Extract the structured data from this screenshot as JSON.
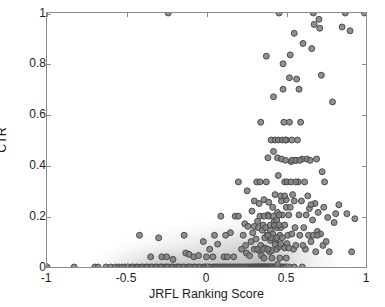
{
  "chart_data": {
    "type": "scatter",
    "title": "",
    "xlabel": "JRFL Ranking Score",
    "ylabel": "CTR",
    "xlim": [
      -1,
      1
    ],
    "ylim": [
      0,
      1
    ],
    "grid": false,
    "legend": null,
    "xticks": [
      "-1",
      "-0.5",
      "0",
      "0.5",
      "1"
    ],
    "xtickvalues": [
      -1,
      -0.5,
      0,
      0.5,
      1
    ],
    "yticks": [
      "0",
      "0.2",
      "0.4",
      "0.6",
      "0.8",
      "1"
    ],
    "ytickvalues": [
      0,
      0.2,
      0.4,
      0.6,
      0.8,
      1
    ],
    "marker": {
      "shape": "circle",
      "size": 6,
      "fill": "#7d7d7d",
      "edge": "#4a4a4a"
    },
    "axis_color": "#8a8a8a",
    "text_color": "#1c1c1c",
    "background": "#ffffff",
    "series": [
      {
        "name": "CTR vs JRFL Ranking Score",
        "points": [
          [
            -1.0,
            0.0
          ],
          [
            -0.83,
            0.0
          ],
          [
            -0.7,
            0.0
          ],
          [
            -0.68,
            0.0
          ],
          [
            -0.63,
            0.0
          ],
          [
            -0.6,
            0.0
          ],
          [
            -0.57,
            0.0
          ],
          [
            -0.55,
            0.0
          ],
          [
            -0.53,
            0.0
          ],
          [
            -0.51,
            0.0
          ],
          [
            -0.49,
            0.0
          ],
          [
            -0.47,
            0.0
          ],
          [
            -0.46,
            0.0
          ],
          [
            -0.44,
            0.0
          ],
          [
            -0.43,
            0.0
          ],
          [
            -0.41,
            0.0
          ],
          [
            -0.4,
            0.0
          ],
          [
            -0.38,
            0.0
          ],
          [
            -0.37,
            0.0
          ],
          [
            -0.35,
            0.0
          ],
          [
            -0.34,
            0.0
          ],
          [
            -0.32,
            0.0
          ],
          [
            -0.31,
            0.0
          ],
          [
            -0.29,
            0.0
          ],
          [
            -0.28,
            0.0
          ],
          [
            -0.26,
            0.0
          ],
          [
            -0.25,
            0.0
          ],
          [
            -0.24,
            0.0
          ],
          [
            -0.22,
            0.0
          ],
          [
            -0.21,
            0.0
          ],
          [
            -0.19,
            0.0
          ],
          [
            -0.18,
            0.0
          ],
          [
            -0.17,
            0.0
          ],
          [
            -0.15,
            0.0
          ],
          [
            -0.14,
            0.0
          ],
          [
            -0.12,
            0.0
          ],
          [
            -0.11,
            0.0
          ],
          [
            -0.1,
            0.0
          ],
          [
            -0.08,
            0.0
          ],
          [
            -0.07,
            0.0
          ],
          [
            -0.05,
            0.0
          ],
          [
            -0.04,
            0.0
          ],
          [
            -0.02,
            0.0
          ],
          [
            -0.01,
            0.0
          ],
          [
            0.0,
            0.0
          ],
          [
            0.01,
            0.0
          ],
          [
            0.02,
            0.0
          ],
          [
            0.04,
            0.0
          ],
          [
            0.05,
            0.0
          ],
          [
            0.06,
            0.0
          ],
          [
            0.07,
            0.0
          ],
          [
            0.08,
            0.0
          ],
          [
            0.09,
            0.0
          ],
          [
            0.1,
            0.0
          ],
          [
            0.11,
            0.0
          ],
          [
            0.12,
            0.0
          ],
          [
            0.13,
            0.0
          ],
          [
            0.14,
            0.0
          ],
          [
            0.15,
            0.0
          ],
          [
            0.16,
            0.0
          ],
          [
            0.17,
            0.0
          ],
          [
            0.18,
            0.0
          ],
          [
            0.19,
            0.0
          ],
          [
            0.2,
            0.0
          ],
          [
            0.21,
            0.0
          ],
          [
            0.22,
            0.0
          ],
          [
            0.23,
            0.0
          ],
          [
            0.24,
            0.0
          ],
          [
            0.25,
            0.0
          ],
          [
            0.26,
            0.0
          ],
          [
            0.27,
            0.0
          ],
          [
            0.28,
            0.0
          ],
          [
            0.285,
            0.0
          ],
          [
            0.29,
            0.0
          ],
          [
            0.3,
            0.0
          ],
          [
            0.305,
            0.0
          ],
          [
            0.31,
            0.0
          ],
          [
            0.315,
            0.0
          ],
          [
            0.32,
            0.0
          ],
          [
            0.325,
            0.0
          ],
          [
            0.33,
            0.0
          ],
          [
            0.335,
            0.0
          ],
          [
            0.34,
            0.0
          ],
          [
            0.345,
            0.0
          ],
          [
            0.35,
            0.0
          ],
          [
            0.355,
            0.0
          ],
          [
            0.36,
            0.0
          ],
          [
            0.365,
            0.0
          ],
          [
            0.37,
            0.0
          ],
          [
            0.375,
            0.0
          ],
          [
            0.38,
            0.0
          ],
          [
            0.385,
            0.0
          ],
          [
            0.39,
            0.0
          ],
          [
            0.395,
            0.0
          ],
          [
            0.4,
            0.0
          ],
          [
            0.405,
            0.0
          ],
          [
            0.41,
            0.0
          ],
          [
            0.415,
            0.0
          ],
          [
            0.42,
            0.0
          ],
          [
            0.43,
            0.0
          ],
          [
            0.44,
            0.0
          ],
          [
            0.45,
            0.0
          ],
          [
            0.46,
            0.0
          ],
          [
            0.47,
            0.0
          ],
          [
            0.48,
            0.0
          ],
          [
            0.49,
            0.0
          ],
          [
            0.5,
            0.0
          ],
          [
            0.52,
            0.0
          ],
          [
            0.55,
            0.0
          ],
          [
            0.6,
            0.0
          ],
          [
            0.445,
            0.01
          ],
          [
            -0.42,
            0.125
          ],
          [
            -0.35,
            0.04
          ],
          [
            -0.3,
            0.115
          ],
          [
            -0.28,
            0.04
          ],
          [
            -0.25,
            0.04
          ],
          [
            -0.21,
            0.03
          ],
          [
            -0.14,
            0.125
          ],
          [
            -0.13,
            0.055
          ],
          [
            -0.11,
            0.05
          ],
          [
            -0.08,
            0.04
          ],
          [
            -0.05,
            0.045
          ],
          [
            -0.02,
            0.1
          ],
          [
            0.0,
            0.04
          ],
          [
            0.02,
            0.07
          ],
          [
            0.04,
            0.04
          ],
          [
            0.05,
            0.125
          ],
          [
            0.07,
            0.09
          ],
          [
            0.09,
            0.2
          ],
          [
            0.11,
            0.04
          ],
          [
            0.13,
            0.04
          ],
          [
            0.15,
            0.135
          ],
          [
            0.17,
            0.04
          ],
          [
            0.18,
            0.2
          ],
          [
            0.2,
            0.335
          ],
          [
            0.2,
            0.2
          ],
          [
            0.22,
            0.07
          ],
          [
            0.23,
            0.125
          ],
          [
            0.24,
            0.17
          ],
          [
            0.25,
            0.055
          ],
          [
            0.255,
            0.3
          ],
          [
            0.26,
            0.16
          ],
          [
            0.27,
            0.045
          ],
          [
            0.28,
            0.1
          ],
          [
            0.285,
            0.22
          ],
          [
            0.29,
            0.135
          ],
          [
            0.3,
            0.16
          ],
          [
            0.3,
            0.26
          ],
          [
            0.31,
            0.11
          ],
          [
            0.315,
            0.335
          ],
          [
            0.32,
            0.18
          ],
          [
            0.325,
            0.155
          ],
          [
            0.33,
            0.25
          ],
          [
            0.335,
            0.335
          ],
          [
            0.34,
            0.57
          ],
          [
            0.34,
            0.085
          ],
          [
            0.345,
            0.045
          ],
          [
            0.35,
            0.145
          ],
          [
            0.355,
            0.165
          ],
          [
            0.36,
            0.265
          ],
          [
            0.365,
            0.075
          ],
          [
            0.37,
            0.155
          ],
          [
            0.375,
            0.335
          ],
          [
            0.375,
            0.83
          ],
          [
            0.38,
            0.125
          ],
          [
            0.385,
            0.43
          ],
          [
            0.385,
            0.205
          ],
          [
            0.39,
            0.255
          ],
          [
            0.395,
            0.06
          ],
          [
            0.4,
            0.145
          ],
          [
            0.4,
            0.105
          ],
          [
            0.405,
            0.5
          ],
          [
            0.41,
            0.065
          ],
          [
            0.415,
            0.13
          ],
          [
            0.42,
            0.455
          ],
          [
            0.42,
            0.67
          ],
          [
            0.425,
            0.18
          ],
          [
            0.43,
            0.5
          ],
          [
            0.43,
            0.285
          ],
          [
            0.435,
            0.105
          ],
          [
            0.44,
            0.07
          ],
          [
            0.44,
            0.155
          ],
          [
            0.445,
            0.43
          ],
          [
            0.445,
            0.215
          ],
          [
            0.45,
            0.5
          ],
          [
            0.45,
            0.36
          ],
          [
            0.455,
            0.08
          ],
          [
            0.455,
            1.0
          ],
          [
            0.46,
            0.125
          ],
          [
            0.465,
            0.155
          ],
          [
            0.47,
            0.26
          ],
          [
            0.47,
            0.425
          ],
          [
            0.475,
            0.205
          ],
          [
            0.48,
            0.8
          ],
          [
            0.48,
            0.7
          ],
          [
            0.485,
            0.57
          ],
          [
            0.49,
            0.165
          ],
          [
            0.49,
            0.335
          ],
          [
            0.495,
            0.42
          ],
          [
            0.5,
            0.5
          ],
          [
            0.5,
            0.265
          ],
          [
            0.505,
            0.092
          ],
          [
            0.51,
            0.125
          ],
          [
            0.515,
            0.205
          ],
          [
            0.52,
            0.57
          ],
          [
            0.52,
            0.745
          ],
          [
            0.525,
            0.835
          ],
          [
            0.53,
            0.415
          ],
          [
            0.535,
            0.13
          ],
          [
            0.54,
            0.285
          ],
          [
            0.545,
            0.07
          ],
          [
            0.55,
            0.26
          ],
          [
            0.55,
            0.92
          ],
          [
            0.555,
            0.155
          ],
          [
            0.56,
            0.42
          ],
          [
            0.565,
            0.74
          ],
          [
            0.57,
            0.5
          ],
          [
            0.575,
            0.335
          ],
          [
            0.58,
            0.205
          ],
          [
            0.58,
            0.7
          ],
          [
            0.585,
            0.125
          ],
          [
            0.59,
            0.57
          ],
          [
            0.595,
            0.26
          ],
          [
            0.6,
            0.425
          ],
          [
            0.605,
            0.88
          ],
          [
            0.61,
            0.155
          ],
          [
            0.615,
            0.335
          ],
          [
            0.62,
            0.07
          ],
          [
            0.625,
            0.205
          ],
          [
            0.63,
            0.425
          ],
          [
            0.635,
            0.28
          ],
          [
            0.64,
            0.125
          ],
          [
            0.645,
            0.23
          ],
          [
            0.65,
            0.42
          ],
          [
            0.655,
            0.1
          ],
          [
            0.66,
            0.86
          ],
          [
            0.665,
            0.185
          ],
          [
            0.67,
            1.0
          ],
          [
            0.675,
            0.955
          ],
          [
            0.68,
            0.25
          ],
          [
            0.685,
            0.06
          ],
          [
            0.69,
            0.425
          ],
          [
            0.695,
            0.14
          ],
          [
            0.7,
            0.215
          ],
          [
            0.705,
            0.975
          ],
          [
            0.71,
            0.94
          ],
          [
            0.715,
            0.13
          ],
          [
            0.72,
            0.755
          ],
          [
            0.725,
            0.375
          ],
          [
            0.73,
            0.085
          ],
          [
            0.735,
            0.235
          ],
          [
            0.74,
            0.335
          ],
          [
            0.75,
            0.1
          ],
          [
            0.76,
            0.195
          ],
          [
            0.77,
            0.06
          ],
          [
            0.79,
            0.65
          ],
          [
            0.8,
            0.175
          ],
          [
            0.81,
            0.21
          ],
          [
            0.83,
            0.245
          ],
          [
            0.85,
            0.945
          ],
          [
            0.87,
            1.0
          ],
          [
            0.88,
            0.21
          ],
          [
            0.9,
            0.93
          ],
          [
            0.91,
            0.06
          ],
          [
            0.93,
            0.19
          ],
          [
            0.99,
            1.0
          ],
          [
            -0.24,
            1.0
          ],
          [
            0.12,
            0.125
          ],
          [
            0.245,
            0.085
          ],
          [
            0.33,
            0.065
          ],
          [
            0.36,
            0.035
          ],
          [
            0.41,
            0.035
          ],
          [
            0.46,
            0.035
          ],
          [
            0.5,
            0.035
          ],
          [
            0.365,
            0.115
          ],
          [
            0.405,
            0.115
          ],
          [
            0.44,
            0.115
          ],
          [
            0.475,
            0.115
          ],
          [
            0.335,
            0.2
          ],
          [
            0.36,
            0.2
          ],
          [
            0.39,
            0.2
          ],
          [
            0.42,
            0.2
          ],
          [
            0.455,
            0.205
          ],
          [
            0.4,
            0.165
          ],
          [
            0.425,
            0.165
          ],
          [
            0.455,
            0.165
          ],
          [
            0.385,
            0.125
          ],
          [
            0.3,
            0.07
          ],
          [
            0.32,
            0.07
          ],
          [
            0.355,
            0.07
          ],
          [
            0.385,
            0.07
          ],
          [
            0.43,
            0.09
          ],
          [
            0.465,
            0.09
          ],
          [
            0.49,
            0.075
          ],
          [
            0.515,
            0.075
          ],
          [
            0.56,
            0.085
          ],
          [
            0.605,
            0.085
          ],
          [
            0.465,
            0.28
          ],
          [
            0.49,
            0.28
          ],
          [
            0.535,
            0.42
          ],
          [
            0.56,
            0.42
          ],
          [
            0.585,
            0.42
          ],
          [
            0.505,
            0.335
          ],
          [
            0.53,
            0.335
          ],
          [
            0.56,
            0.335
          ],
          [
            0.475,
            0.5
          ],
          [
            0.495,
            0.5
          ],
          [
            0.535,
            0.5
          ],
          [
            0.44,
            0.185
          ],
          [
            0.415,
            0.235
          ],
          [
            0.5,
            0.235
          ],
          [
            0.525,
            0.235
          ],
          [
            0.655,
            0.245
          ],
          [
            0.67,
            0.125
          ],
          [
            0.695,
            0.125
          ]
        ]
      }
    ]
  }
}
